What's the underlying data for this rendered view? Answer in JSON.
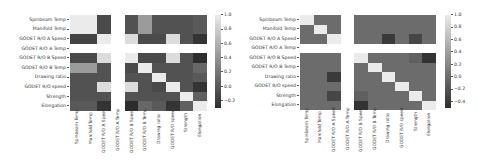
{
  "chart_data": [
    {
      "type": "heatmap",
      "title": "",
      "xlabel": "",
      "ylabel": "",
      "row_labels": [
        "Spinbeam Temp",
        "Manifold Temp",
        "GODET R/O A Speed",
        "GODET R/O A Temp",
        "GODET R/O B Speed",
        "GODET R/O B Temp",
        "Drawing ratio",
        "GODET R/O speed",
        "Strength",
        "Elongation"
      ],
      "col_labels": [
        "Spinbeam Temp",
        "Manifold Temp",
        "GODET R/O A Speed",
        "GODET R/O A Temp",
        "GODET R/O B Speed",
        "GODET R/O B Temp",
        "Drawing ratio",
        "GODET R/O speed",
        "Strength",
        "Elongation"
      ],
      "values": [
        [
          1.0,
          1.0,
          -0.1,
          null,
          -0.05,
          0.45,
          -0.05,
          -0.05,
          -0.05,
          0.0
        ],
        [
          1.0,
          1.0,
          -0.1,
          null,
          -0.05,
          0.45,
          -0.05,
          -0.05,
          -0.05,
          0.0
        ],
        [
          -0.15,
          -0.15,
          1.0,
          null,
          0.9,
          -0.1,
          -0.1,
          0.9,
          -0.05,
          -0.25
        ],
        [
          null,
          null,
          null,
          null,
          null,
          null,
          null,
          null,
          null,
          null
        ],
        [
          -0.1,
          -0.1,
          0.9,
          null,
          1.0,
          -0.1,
          -0.1,
          0.9,
          -0.05,
          -0.3
        ],
        [
          0.45,
          0.45,
          -0.05,
          null,
          -0.1,
          1.0,
          -0.05,
          -0.05,
          -0.05,
          0.1
        ],
        [
          -0.05,
          -0.05,
          -0.05,
          null,
          -0.05,
          -0.05,
          1.0,
          -0.05,
          -0.05,
          0.0
        ],
        [
          -0.05,
          -0.05,
          0.9,
          null,
          0.9,
          -0.05,
          -0.1,
          1.0,
          -0.05,
          -0.25
        ],
        [
          -0.05,
          -0.05,
          -0.05,
          null,
          -0.05,
          -0.05,
          -0.05,
          -0.05,
          1.0,
          0.05
        ],
        [
          0.0,
          0.0,
          -0.25,
          null,
          -0.3,
          0.1,
          0.0,
          -0.25,
          0.05,
          1.0
        ]
      ],
      "colorbar": {
        "min": -0.3,
        "max": 1.0,
        "ticks": [
          "1.0",
          "0.8",
          "0.6",
          "0.4",
          "0.2",
          "0.0",
          "−0.2"
        ]
      },
      "colormap": "gray",
      "grid": false
    },
    {
      "type": "heatmap",
      "title": "",
      "xlabel": "",
      "ylabel": "",
      "row_labels": [
        "Spinbeam Temp",
        "Manifold Temp",
        "GODET R/O A Speed",
        "GODET R/O A Temp",
        "GODET R/O B Speed",
        "GODET R/O B Temp",
        "Drawing ratio",
        "GODET R/O speed",
        "Strength",
        "Elongation"
      ],
      "col_labels": [
        "Spinbeam Temp",
        "Manifold Temp",
        "GODET R/O A Speed",
        "GODET R/O A Temp",
        "GODET R/O B Speed",
        "GODET R/O B Temp",
        "Drawing ratio",
        "GODET R/O speed",
        "Strength",
        "Elongation"
      ],
      "values": [
        [
          1.0,
          0.0,
          0.0,
          null,
          0.0,
          0.0,
          0.0,
          0.0,
          0.0,
          0.0
        ],
        [
          0.0,
          1.0,
          0.0,
          null,
          0.0,
          0.0,
          0.0,
          0.0,
          0.0,
          0.0
        ],
        [
          0.0,
          0.0,
          1.0,
          null,
          0.0,
          0.0,
          -0.4,
          0.0,
          -0.3,
          0.0
        ],
        [
          null,
          null,
          null,
          null,
          null,
          null,
          null,
          null,
          null,
          null
        ],
        [
          0.0,
          0.0,
          0.0,
          null,
          1.0,
          0.0,
          0.0,
          0.0,
          -0.1,
          -0.45
        ],
        [
          0.0,
          0.0,
          0.0,
          null,
          0.0,
          1.0,
          0.0,
          0.0,
          0.0,
          0.0
        ],
        [
          0.0,
          0.0,
          -0.4,
          null,
          0.0,
          0.0,
          1.0,
          0.0,
          0.0,
          0.0
        ],
        [
          0.0,
          0.0,
          0.0,
          null,
          0.0,
          0.0,
          0.0,
          1.0,
          0.0,
          0.0
        ],
        [
          0.0,
          0.0,
          -0.3,
          null,
          -0.1,
          0.0,
          0.0,
          0.0,
          1.0,
          0.0
        ],
        [
          0.0,
          0.0,
          0.0,
          null,
          -0.45,
          0.0,
          0.0,
          0.0,
          0.0,
          1.0
        ]
      ],
      "colorbar": {
        "min": -0.5,
        "max": 1.0,
        "ticks": [
          "1.0",
          "0.8",
          "0.6",
          "0.4",
          "0.2",
          "0.0",
          "−0.2",
          "−0.4"
        ]
      },
      "colormap": "gray",
      "grid": false
    }
  ]
}
